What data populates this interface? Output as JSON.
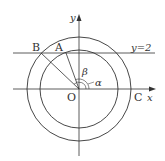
{
  "diagram": {
    "type": "geometry",
    "axes": {
      "x_label": "x",
      "y_label": "y"
    },
    "line": {
      "label": "y=2"
    },
    "points": {
      "O": "O",
      "A": "A",
      "B": "B",
      "C": "C"
    },
    "angles": {
      "alpha": "α",
      "beta": "β"
    },
    "colors": {
      "stroke": "#333333",
      "background": "#ffffff"
    }
  }
}
